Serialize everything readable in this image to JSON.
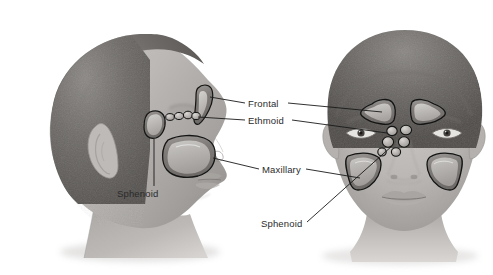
{
  "figure": {
    "background_color": "#ffffff",
    "line_color": "#1a1a1a",
    "text_color": "#2b2b2b",
    "width": 493,
    "height": 275
  },
  "views": {
    "lateral": {
      "name": "Lateral (profile) view of head",
      "orientation": "facing right"
    },
    "frontal": {
      "name": "Frontal (anterior) view of head",
      "orientation": "facing viewer"
    }
  },
  "labels": {
    "frontal": "Frontal",
    "ethmoid": "Ethmoid",
    "maxillary": "Maxillary",
    "sphenoid_lateral": "Sphenoid",
    "sphenoid_frontal": "Sphenoid"
  },
  "sinuses": [
    {
      "name": "Frontal sinus",
      "views": [
        "lateral",
        "frontal"
      ],
      "count_frontal": 2
    },
    {
      "name": "Ethmoid sinus",
      "views": [
        "lateral",
        "frontal"
      ],
      "description": "chain of small air cells"
    },
    {
      "name": "Maxillary sinus",
      "views": [
        "lateral",
        "frontal"
      ],
      "count_frontal": 2
    },
    {
      "name": "Sphenoid sinus",
      "views": [
        "lateral",
        "frontal"
      ]
    }
  ],
  "colors": {
    "skin_light": "#d8d5d2",
    "skin_mid": "#b3b0ad",
    "skin_dark": "#8d8a87",
    "hair_dark": "#5a5755",
    "sinus_fill": "#8e8b88",
    "sinus_highlight": "#cfcdca",
    "outline": "#1a1a1a"
  }
}
